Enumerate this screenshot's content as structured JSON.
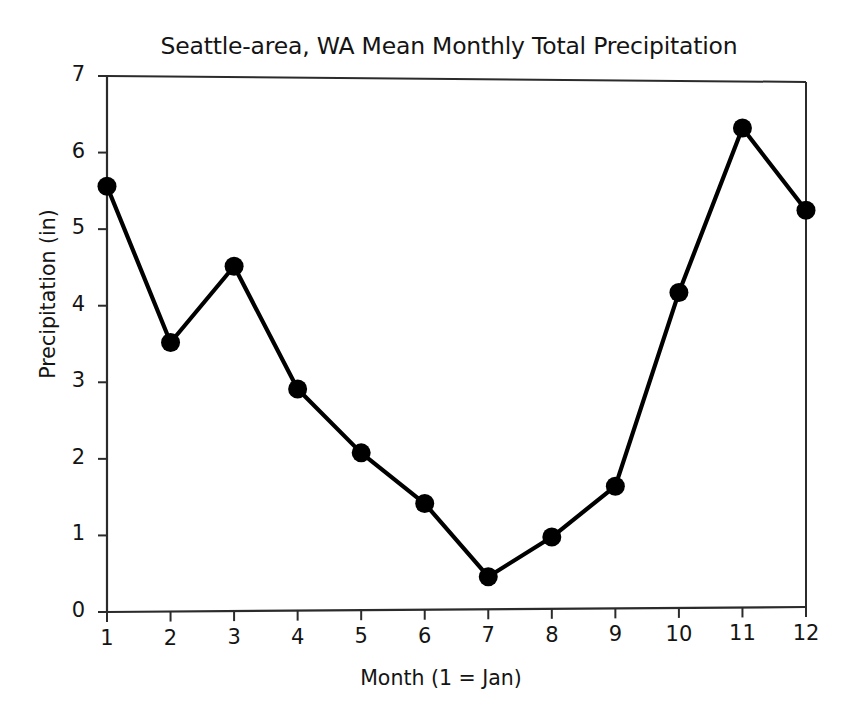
{
  "chart_data": {
    "type": "line",
    "title": "Seattle-area, WA Mean Monthly Total Precipitation",
    "xlabel": "Month (1 = Jan)",
    "ylabel": "Precipitation (in)",
    "x": [
      1,
      2,
      3,
      4,
      5,
      6,
      7,
      8,
      9,
      10,
      11,
      12
    ],
    "values": [
      5.56,
      3.52,
      4.52,
      2.91,
      2.07,
      1.4,
      0.43,
      0.95,
      1.62,
      4.19,
      6.38,
      5.29
    ],
    "categories": [
      "1",
      "2",
      "3",
      "4",
      "5",
      "6",
      "7",
      "8",
      "9",
      "10",
      "11",
      "12"
    ],
    "xlim": [
      1,
      12
    ],
    "ylim": [
      0,
      7
    ],
    "xticks": [
      1,
      2,
      3,
      4,
      5,
      6,
      7,
      8,
      9,
      10,
      11,
      12
    ],
    "yticks": [
      0,
      1,
      2,
      3,
      4,
      5,
      6,
      7
    ],
    "xtick_labels": [
      "1",
      "2",
      "3",
      "4",
      "5",
      "6",
      "7",
      "8",
      "9",
      "10",
      "11",
      "12"
    ],
    "ytick_labels": [
      "0",
      "1",
      "2",
      "3",
      "4",
      "5",
      "6",
      "7"
    ],
    "grid": false,
    "legend": null,
    "series": [
      {
        "name": "Mean Monthly Total Precipitation",
        "values": [
          5.56,
          3.52,
          4.52,
          2.91,
          2.07,
          1.4,
          0.43,
          0.95,
          1.62,
          4.19,
          6.38,
          5.29
        ],
        "line_color": "#000000",
        "marker": "circle",
        "marker_color": "#000000"
      }
    ],
    "colors": {
      "background": "#ffffff",
      "line": "#000000",
      "marker": "#000000",
      "axis": "#2b2b2b",
      "text": "#141414"
    }
  }
}
